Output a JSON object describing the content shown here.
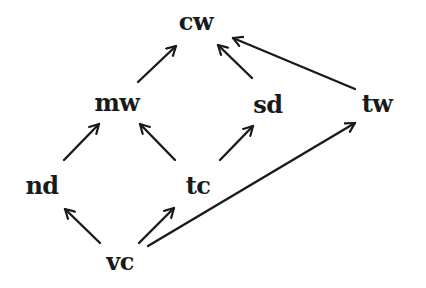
{
  "diagram": {
    "type": "directed-graph",
    "nodes": [
      {
        "id": "cw",
        "label": "cw",
        "x": 196,
        "y": 22
      },
      {
        "id": "mw",
        "label": "mw",
        "x": 117,
        "y": 103
      },
      {
        "id": "sd",
        "label": "sd",
        "x": 268,
        "y": 105
      },
      {
        "id": "tw",
        "label": "tw",
        "x": 377,
        "y": 104
      },
      {
        "id": "nd",
        "label": "nd",
        "x": 42,
        "y": 186
      },
      {
        "id": "tc",
        "label": "tc",
        "x": 198,
        "y": 186
      },
      {
        "id": "vc",
        "label": "vc",
        "x": 120,
        "y": 262
      }
    ],
    "edges": [
      {
        "from": "mw",
        "to": "cw",
        "x1": 138,
        "y1": 82,
        "x2": 176,
        "y2": 46
      },
      {
        "from": "sd",
        "to": "cw",
        "x1": 252,
        "y1": 78,
        "x2": 218,
        "y2": 45
      },
      {
        "from": "tw",
        "to": "cw",
        "x1": 355,
        "y1": 89,
        "x2": 233,
        "y2": 38
      },
      {
        "from": "nd",
        "to": "mw",
        "x1": 64,
        "y1": 160,
        "x2": 99,
        "y2": 124
      },
      {
        "from": "tc",
        "to": "mw",
        "x1": 175,
        "y1": 160,
        "x2": 140,
        "y2": 124
      },
      {
        "from": "tc",
        "to": "sd",
        "x1": 220,
        "y1": 160,
        "x2": 253,
        "y2": 126
      },
      {
        "from": "vc",
        "to": "nd",
        "x1": 100,
        "y1": 243,
        "x2": 65,
        "y2": 209
      },
      {
        "from": "vc",
        "to": "tc",
        "x1": 139,
        "y1": 243,
        "x2": 174,
        "y2": 208
      },
      {
        "from": "vc",
        "to": "tw",
        "x1": 148,
        "y1": 246,
        "x2": 355,
        "y2": 123
      }
    ],
    "colors": {
      "stroke": "#1a1a1a",
      "text": "#1a1a1a",
      "background": "#ffffff"
    }
  }
}
